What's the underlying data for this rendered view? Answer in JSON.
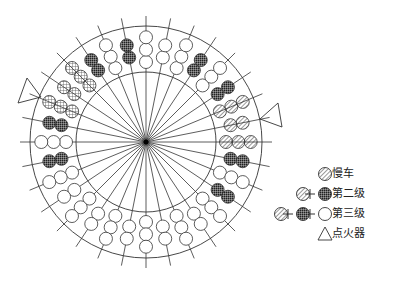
{
  "diagram": {
    "center": [
      146,
      142
    ],
    "outer_radius": 116,
    "inner_radius": 70,
    "spoke_outer_radius": 126,
    "stroke_color": "#333333",
    "fill_dark": "#555555",
    "nozzle_circle_radius": 6.5,
    "nozzle_start_radius": 80,
    "nozzles": [
      {
        "angle": 0,
        "type": "open",
        "count": 3
      },
      {
        "angle": 11.25,
        "type": "open",
        "count": 2
      },
      {
        "angle": 22.5,
        "type": "open",
        "count": 3
      },
      {
        "angle": 33.75,
        "type": "dark",
        "count": 2
      },
      {
        "angle": 45,
        "type": "open",
        "count": 3
      },
      {
        "angle": 56.25,
        "type": "dark",
        "count": 2
      },
      {
        "angle": 67.5,
        "type": "hatch",
        "count": 3
      },
      {
        "angle": 78.75,
        "type": "hatch",
        "count": 2
      },
      {
        "angle": 90,
        "type": "hatch",
        "count": 3
      },
      {
        "angle": 101.25,
        "type": "dark",
        "count": 2
      },
      {
        "angle": 112.5,
        "type": "open",
        "count": 3
      },
      {
        "angle": 123.75,
        "type": "dark",
        "count": 2
      },
      {
        "angle": 135,
        "type": "open",
        "count": 3
      },
      {
        "angle": 146.25,
        "type": "open",
        "count": 2
      },
      {
        "angle": 157.5,
        "type": "open",
        "count": 3
      },
      {
        "angle": 168.75,
        "type": "open",
        "count": 2
      },
      {
        "angle": 180,
        "type": "open",
        "count": 3
      },
      {
        "angle": 191.25,
        "type": "open",
        "count": 2
      },
      {
        "angle": 202.5,
        "type": "open",
        "count": 3
      },
      {
        "angle": 213.75,
        "type": "open",
        "count": 2
      },
      {
        "angle": 225,
        "type": "open",
        "count": 3
      },
      {
        "angle": 236.25,
        "type": "open",
        "count": 2
      },
      {
        "angle": 247.5,
        "type": "open",
        "count": 3
      },
      {
        "angle": 258.75,
        "type": "dark",
        "count": 2
      },
      {
        "angle": 270,
        "type": "open",
        "count": 3
      },
      {
        "angle": 281.25,
        "type": "dark",
        "count": 2
      },
      {
        "angle": 292.5,
        "type": "grid",
        "count": 3
      },
      {
        "angle": 303.75,
        "type": "grid",
        "count": 2
      },
      {
        "angle": 315,
        "type": "grid",
        "count": 3
      },
      {
        "angle": 326.25,
        "type": "dark",
        "count": 2
      },
      {
        "angle": 337.5,
        "type": "open",
        "count": 3
      },
      {
        "angle": 348.75,
        "type": "dark",
        "count": 2
      }
    ],
    "igniters": [
      {
        "points": [
          [
            27,
            78
          ],
          [
            18,
            103
          ],
          [
            41,
            97
          ]
        ]
      },
      {
        "points": [
          [
            260,
            119
          ],
          [
            278,
            103
          ],
          [
            282,
            127
          ]
        ]
      }
    ]
  },
  "legend": {
    "items": [
      {
        "label": "慢车",
        "symbols": [
          "hatch"
        ],
        "y": 174
      },
      {
        "label": "第二级",
        "symbols": [
          "hatch",
          "+",
          "dark"
        ],
        "y": 194
      },
      {
        "label": "第三级",
        "symbols": [
          "hatch",
          "+",
          "dark",
          "+",
          "open"
        ],
        "y": 214
      },
      {
        "label": "点火器",
        "symbols": [
          "triangle"
        ],
        "y": 234
      }
    ],
    "symbol_right_x": 325,
    "label_x": 332
  }
}
